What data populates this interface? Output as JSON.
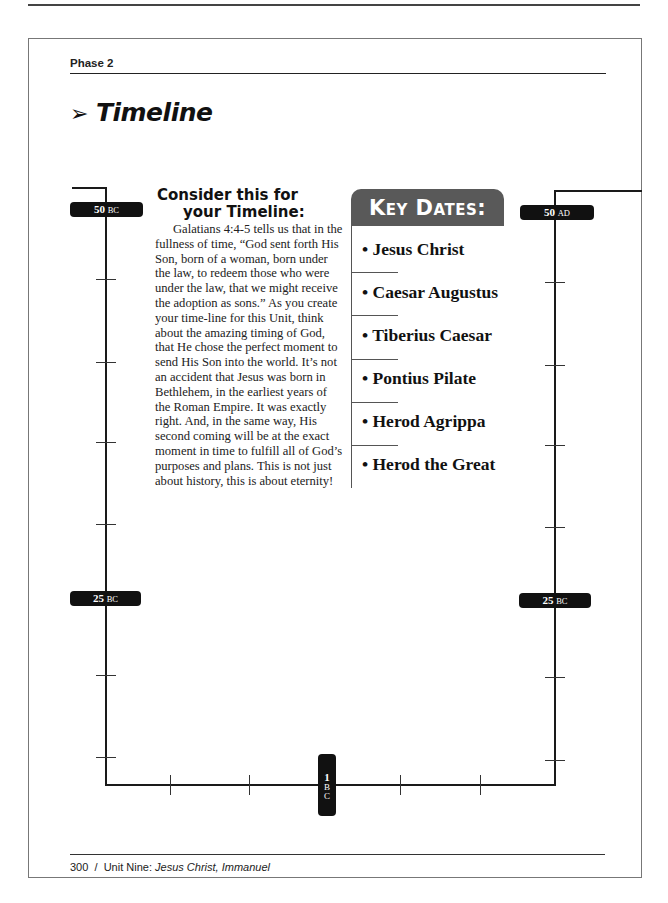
{
  "header": {
    "phase": "Phase 2"
  },
  "title": {
    "arrow": "➢",
    "text": "Timeline"
  },
  "consider": {
    "heading_line1": "Consider this for",
    "heading_line2": "your Timeline:",
    "body": "Galatians 4:4-5 tells us that in the fullness of time, “God sent forth His Son, born of a woman, born under the law, to redeem those who were under the law, that we might receive the adoption as sons.” As you create your time-line for this Unit, think about the amazing timing of God, that He chose the perfect moment to send His Son into the world. It’s not an accident that Jesus was born in Bethlehem, in the earliest years of the Roman Empire. It was exactly right. And, in the same way, His second coming will be at the exact moment in time to fulfill all of God’s purposes and plans. This is not just about history, this is about eternity!"
  },
  "key_dates": {
    "heading": "Key Dates:",
    "items": [
      "• Jesus Christ",
      "• Caesar Augustus",
      "• Tiberius Caesar",
      "• Pontius Pilate",
      "• Herod Agrippa",
      "• Herod the Great"
    ]
  },
  "timeline": {
    "labels": {
      "left_top": {
        "num": "50",
        "era": "BC"
      },
      "left_mid": {
        "num": "25",
        "era": "BC"
      },
      "bottom": {
        "num": "1",
        "era1": "B",
        "era2": "C"
      },
      "right_mid": {
        "num": "25",
        "era": "BC"
      },
      "right_top": {
        "num": "50",
        "era": "AD"
      }
    }
  },
  "footer": {
    "page": "300",
    "separator": "/",
    "unit": "Unit Nine:",
    "unit_title": "Jesus Christ, Immanuel"
  }
}
